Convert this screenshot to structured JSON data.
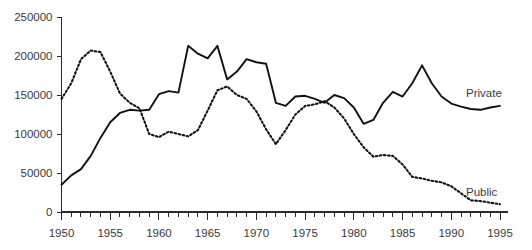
{
  "chart_data": {
    "type": "line",
    "title": "",
    "subtitle": "",
    "xlabel": "",
    "ylabel": "",
    "xlim": [
      1950,
      1995
    ],
    "ylim": [
      0,
      250000
    ],
    "grid": false,
    "legend_position": "inline-right",
    "y_ticks": [
      0,
      50000,
      100000,
      150000,
      200000,
      250000
    ],
    "y_tick_labels": [
      "0",
      "50000",
      "100000",
      "150000",
      "200000",
      "250000"
    ],
    "x_ticks": [
      1950,
      1951,
      1952,
      1953,
      1954,
      1955,
      1956,
      1957,
      1958,
      1959,
      1960,
      1961,
      1962,
      1963,
      1964,
      1965,
      1966,
      1967,
      1968,
      1969,
      1970,
      1971,
      1972,
      1973,
      1974,
      1975,
      1976,
      1977,
      1978,
      1979,
      1980,
      1981,
      1982,
      1983,
      1984,
      1985,
      1986,
      1987,
      1988,
      1989,
      1990,
      1991,
      1992,
      1993,
      1994,
      1995
    ],
    "x_tick_labels": [
      "1950",
      "1955",
      "1960",
      "1965",
      "1970",
      "1975",
      "1980",
      "1985",
      "1990",
      "1995"
    ],
    "x_tick_label_values": [
      1950,
      1955,
      1960,
      1965,
      1970,
      1975,
      1980,
      1985,
      1990,
      1995
    ],
    "x": [
      1950,
      1951,
      1952,
      1953,
      1954,
      1955,
      1956,
      1957,
      1958,
      1959,
      1960,
      1961,
      1962,
      1963,
      1964,
      1965,
      1966,
      1967,
      1968,
      1969,
      1970,
      1971,
      1972,
      1973,
      1974,
      1975,
      1976,
      1977,
      1978,
      1979,
      1980,
      1981,
      1982,
      1983,
      1984,
      1985,
      1986,
      1987,
      1988,
      1989,
      1990,
      1991,
      1992,
      1993,
      1994,
      1995
    ],
    "series": [
      {
        "name": "Private",
        "style": "solid",
        "color": "#111111",
        "label": "Private",
        "values": [
          35000,
          47000,
          55000,
          72000,
          95000,
          115000,
          127000,
          131000,
          130000,
          131000,
          151000,
          155000,
          153000,
          213000,
          203000,
          197000,
          213000,
          170000,
          180000,
          196000,
          192000,
          190000,
          140000,
          136000,
          148000,
          149000,
          145000,
          140000,
          150000,
          146000,
          134000,
          113000,
          118000,
          140000,
          154000,
          148000,
          165000,
          188000,
          165000,
          148000,
          139000,
          135000,
          132000,
          131000,
          134000,
          136000
        ]
      },
      {
        "name": "Public",
        "style": "dotted",
        "color": "#111111",
        "label": "Public",
        "values": [
          145000,
          165000,
          196000,
          207000,
          205000,
          180000,
          152000,
          140000,
          133000,
          100000,
          96000,
          103000,
          100000,
          97000,
          105000,
          130000,
          156000,
          161000,
          150000,
          145000,
          129000,
          106000,
          87000,
          105000,
          125000,
          136000,
          138000,
          142000,
          134000,
          120000,
          100000,
          83000,
          71000,
          73000,
          72000,
          61000,
          45000,
          43000,
          40000,
          38000,
          33000,
          24000,
          15000,
          14000,
          12000,
          10000
        ]
      }
    ]
  },
  "labels": {
    "private": "Private",
    "public": "Public"
  }
}
